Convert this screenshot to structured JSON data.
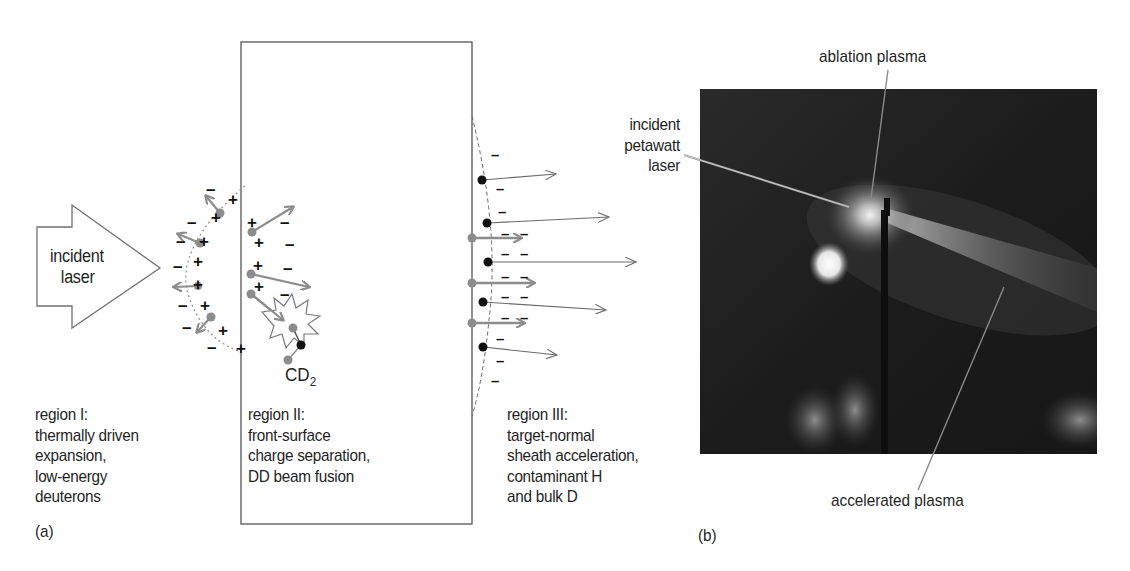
{
  "panel_a": {
    "tag": "(a)",
    "arrow_label": [
      "incident",
      "laser"
    ],
    "molecule_label": "CD",
    "molecule_subscript": "2",
    "regions": [
      {
        "title": "region I:",
        "lines": [
          "thermally driven",
          "expansion,",
          "low-energy",
          "deuterons"
        ]
      },
      {
        "title": "region II:",
        "lines": [
          "front-surface",
          "charge separation,",
          "DD beam fusion"
        ]
      },
      {
        "title": "region III:",
        "lines": [
          "target-normal",
          "sheath acceleration,",
          "contaminant H",
          "and bulk D"
        ]
      }
    ],
    "symbols": {
      "plus": "+",
      "minus": "–"
    },
    "colors": {
      "ion_gray": "#8c8c8c",
      "electron_black": "#111111",
      "line": "#555555"
    }
  },
  "panel_b": {
    "tag": "(b)",
    "callouts": {
      "ablation": "ablation plasma",
      "incident": [
        "incident",
        "petawatt",
        "laser"
      ],
      "accelerated": "accelerated plasma"
    }
  }
}
